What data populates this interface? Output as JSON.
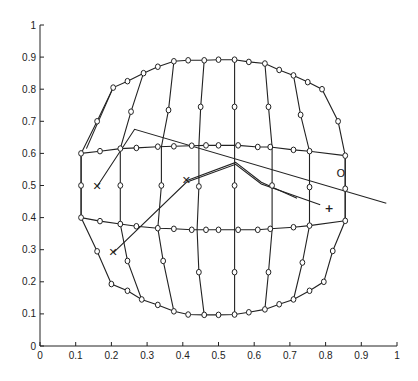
{
  "chart_data": {
    "type": "line",
    "title": "",
    "xlabel": "",
    "ylabel": "",
    "xlim": [
      0,
      1
    ],
    "ylim": [
      0,
      1
    ],
    "grid": false,
    "xticks": [
      "0",
      "0.1",
      "0.2",
      "0.3",
      "0.4",
      "0.5",
      "0.6",
      "0.7",
      "0.8",
      "0.9",
      "1"
    ],
    "yticks": [
      "0",
      "0.1",
      "0.2",
      "0.3",
      "0.4",
      "0.5",
      "0.6",
      "0.7",
      "0.8",
      "0.9",
      "1"
    ],
    "mesh_outline": {
      "name": "deformed grid boundary",
      "points": [
        [
          0.115,
          0.6
        ],
        [
          0.16,
          0.7
        ],
        [
          0.205,
          0.805
        ],
        [
          0.245,
          0.825
        ],
        [
          0.29,
          0.85
        ],
        [
          0.33,
          0.87
        ],
        [
          0.375,
          0.887
        ],
        [
          0.415,
          0.89
        ],
        [
          0.46,
          0.89
        ],
        [
          0.5,
          0.892
        ],
        [
          0.545,
          0.892
        ],
        [
          0.585,
          0.885
        ],
        [
          0.63,
          0.88
        ],
        [
          0.67,
          0.86
        ],
        [
          0.71,
          0.843
        ],
        [
          0.75,
          0.822
        ],
        [
          0.79,
          0.8
        ],
        [
          0.835,
          0.7
        ],
        [
          0.855,
          0.593
        ],
        [
          0.855,
          0.39
        ],
        [
          0.82,
          0.296
        ],
        [
          0.795,
          0.2
        ],
        [
          0.755,
          0.172
        ],
        [
          0.71,
          0.145
        ],
        [
          0.67,
          0.13
        ],
        [
          0.63,
          0.114
        ],
        [
          0.585,
          0.105
        ],
        [
          0.545,
          0.098
        ],
        [
          0.5,
          0.097
        ],
        [
          0.46,
          0.097
        ],
        [
          0.415,
          0.098
        ],
        [
          0.375,
          0.108
        ],
        [
          0.33,
          0.128
        ],
        [
          0.285,
          0.145
        ],
        [
          0.245,
          0.172
        ],
        [
          0.2,
          0.193
        ],
        [
          0.16,
          0.295
        ],
        [
          0.115,
          0.4
        ]
      ]
    },
    "mesh_rows": [
      {
        "name": "row-0.6",
        "points": [
          [
            0.115,
            0.6
          ],
          [
            0.168,
            0.607
          ],
          [
            0.225,
            0.615
          ],
          [
            0.27,
            0.617
          ],
          [
            0.33,
            0.621
          ],
          [
            0.375,
            0.622
          ],
          [
            0.425,
            0.624
          ],
          [
            0.465,
            0.625
          ],
          [
            0.5,
            0.625
          ],
          [
            0.555,
            0.625
          ],
          [
            0.61,
            0.62
          ],
          [
            0.645,
            0.62
          ],
          [
            0.71,
            0.611
          ],
          [
            0.755,
            0.607
          ],
          [
            0.855,
            0.593
          ]
        ]
      },
      {
        "name": "row-0.4",
        "points": [
          [
            0.115,
            0.4
          ],
          [
            0.168,
            0.389
          ],
          [
            0.225,
            0.38
          ],
          [
            0.27,
            0.373
          ],
          [
            0.33,
            0.367
          ],
          [
            0.375,
            0.365
          ],
          [
            0.425,
            0.362
          ],
          [
            0.465,
            0.362
          ],
          [
            0.5,
            0.362
          ],
          [
            0.555,
            0.362
          ],
          [
            0.61,
            0.362
          ],
          [
            0.645,
            0.365
          ],
          [
            0.71,
            0.37
          ],
          [
            0.755,
            0.375
          ],
          [
            0.855,
            0.39
          ]
        ]
      }
    ],
    "mesh_columns": [
      {
        "name": "col-1",
        "points": [
          [
            0.205,
            0.805
          ],
          [
            0.13,
            0.615
          ]
        ]
      },
      {
        "name": "col-2",
        "points": [
          [
            0.29,
            0.85
          ],
          [
            0.255,
            0.73
          ],
          [
            0.225,
            0.615
          ],
          [
            0.225,
            0.5
          ],
          [
            0.225,
            0.38
          ],
          [
            0.245,
            0.265
          ],
          [
            0.285,
            0.145
          ]
        ]
      },
      {
        "name": "col-3",
        "points": [
          [
            0.375,
            0.887
          ],
          [
            0.36,
            0.735
          ],
          [
            0.34,
            0.62
          ],
          [
            0.34,
            0.5
          ],
          [
            0.33,
            0.367
          ],
          [
            0.345,
            0.265
          ],
          [
            0.375,
            0.108
          ]
        ]
      },
      {
        "name": "col-4",
        "points": [
          [
            0.46,
            0.89
          ],
          [
            0.45,
            0.745
          ],
          [
            0.445,
            0.624
          ],
          [
            0.445,
            0.497
          ],
          [
            0.44,
            0.362
          ],
          [
            0.445,
            0.23
          ],
          [
            0.46,
            0.097
          ]
        ]
      },
      {
        "name": "col-5",
        "points": [
          [
            0.545,
            0.892
          ],
          [
            0.545,
            0.745
          ],
          [
            0.545,
            0.625
          ],
          [
            0.545,
            0.5
          ],
          [
            0.545,
            0.362
          ],
          [
            0.545,
            0.23
          ],
          [
            0.545,
            0.098
          ]
        ]
      },
      {
        "name": "col-6",
        "points": [
          [
            0.63,
            0.88
          ],
          [
            0.64,
            0.745
          ],
          [
            0.65,
            0.62
          ],
          [
            0.65,
            0.5
          ],
          [
            0.65,
            0.362
          ],
          [
            0.64,
            0.23
          ],
          [
            0.63,
            0.114
          ]
        ]
      },
      {
        "name": "col-7",
        "points": [
          [
            0.71,
            0.843
          ],
          [
            0.73,
            0.72
          ],
          [
            0.755,
            0.607
          ],
          [
            0.755,
            0.495
          ],
          [
            0.755,
            0.375
          ],
          [
            0.735,
            0.26
          ],
          [
            0.71,
            0.145
          ]
        ]
      },
      {
        "name": "col-left",
        "points": [
          [
            0.115,
            0.6
          ],
          [
            0.115,
            0.5
          ],
          [
            0.115,
            0.4
          ]
        ]
      },
      {
        "name": "col-right",
        "points": [
          [
            0.855,
            0.593
          ],
          [
            0.855,
            0.49
          ],
          [
            0.855,
            0.39
          ]
        ]
      }
    ],
    "nodes": [
      [
        0.115,
        0.6
      ],
      [
        0.115,
        0.5
      ],
      [
        0.115,
        0.4
      ],
      [
        0.16,
        0.7
      ],
      [
        0.205,
        0.805
      ],
      [
        0.245,
        0.825
      ],
      [
        0.29,
        0.85
      ],
      [
        0.33,
        0.87
      ],
      [
        0.375,
        0.887
      ],
      [
        0.415,
        0.89
      ],
      [
        0.46,
        0.89
      ],
      [
        0.5,
        0.892
      ],
      [
        0.545,
        0.892
      ],
      [
        0.585,
        0.885
      ],
      [
        0.63,
        0.88
      ],
      [
        0.67,
        0.86
      ],
      [
        0.71,
        0.843
      ],
      [
        0.75,
        0.822
      ],
      [
        0.79,
        0.8
      ],
      [
        0.835,
        0.7
      ],
      [
        0.855,
        0.593
      ],
      [
        0.855,
        0.49
      ],
      [
        0.855,
        0.39
      ],
      [
        0.82,
        0.296
      ],
      [
        0.795,
        0.2
      ],
      [
        0.755,
        0.172
      ],
      [
        0.71,
        0.145
      ],
      [
        0.67,
        0.13
      ],
      [
        0.63,
        0.114
      ],
      [
        0.585,
        0.105
      ],
      [
        0.545,
        0.098
      ],
      [
        0.5,
        0.097
      ],
      [
        0.46,
        0.097
      ],
      [
        0.415,
        0.098
      ],
      [
        0.375,
        0.108
      ],
      [
        0.33,
        0.128
      ],
      [
        0.285,
        0.145
      ],
      [
        0.245,
        0.172
      ],
      [
        0.2,
        0.193
      ],
      [
        0.16,
        0.295
      ],
      [
        0.168,
        0.607
      ],
      [
        0.225,
        0.615
      ],
      [
        0.27,
        0.617
      ],
      [
        0.33,
        0.621
      ],
      [
        0.375,
        0.622
      ],
      [
        0.425,
        0.624
      ],
      [
        0.465,
        0.625
      ],
      [
        0.5,
        0.625
      ],
      [
        0.555,
        0.625
      ],
      [
        0.61,
        0.62
      ],
      [
        0.645,
        0.62
      ],
      [
        0.71,
        0.611
      ],
      [
        0.755,
        0.607
      ],
      [
        0.168,
        0.389
      ],
      [
        0.225,
        0.38
      ],
      [
        0.27,
        0.373
      ],
      [
        0.33,
        0.367
      ],
      [
        0.375,
        0.365
      ],
      [
        0.425,
        0.362
      ],
      [
        0.465,
        0.362
      ],
      [
        0.5,
        0.362
      ],
      [
        0.555,
        0.362
      ],
      [
        0.61,
        0.362
      ],
      [
        0.645,
        0.365
      ],
      [
        0.71,
        0.37
      ],
      [
        0.755,
        0.375
      ],
      [
        0.255,
        0.73
      ],
      [
        0.36,
        0.735
      ],
      [
        0.45,
        0.745
      ],
      [
        0.545,
        0.745
      ],
      [
        0.64,
        0.745
      ],
      [
        0.73,
        0.72
      ],
      [
        0.225,
        0.5
      ],
      [
        0.34,
        0.5
      ],
      [
        0.445,
        0.497
      ],
      [
        0.545,
        0.5
      ],
      [
        0.65,
        0.5
      ],
      [
        0.755,
        0.495
      ],
      [
        0.245,
        0.265
      ],
      [
        0.345,
        0.265
      ],
      [
        0.445,
        0.23
      ],
      [
        0.545,
        0.23
      ],
      [
        0.64,
        0.23
      ],
      [
        0.735,
        0.26
      ]
    ],
    "trajectories": [
      {
        "name": "trajectory-a",
        "points": [
          [
            0.16,
            0.497
          ],
          [
            0.265,
            0.675
          ],
          [
            0.97,
            0.445
          ]
        ]
      },
      {
        "name": "trajectory-b",
        "points": [
          [
            0.205,
            0.29
          ],
          [
            0.41,
            0.51
          ],
          [
            0.548,
            0.566
          ],
          [
            0.62,
            0.505
          ],
          [
            0.785,
            0.44
          ]
        ]
      },
      {
        "name": "trajectory-b-offset",
        "points": [
          [
            0.41,
            0.515
          ],
          [
            0.548,
            0.572
          ],
          [
            0.62,
            0.51
          ],
          [
            0.72,
            0.46
          ]
        ]
      }
    ],
    "markers": [
      {
        "name": "x-marker-1",
        "symbol": "✕",
        "x": 0.16,
        "y": 0.497
      },
      {
        "name": "x-marker-2",
        "symbol": "✕",
        "x": 0.205,
        "y": 0.29
      },
      {
        "name": "x-marker-3",
        "symbol": "✕",
        "x": 0.41,
        "y": 0.514
      },
      {
        "name": "plus-marker",
        "symbol": "+",
        "x": 0.81,
        "y": 0.434
      },
      {
        "name": "o-marker",
        "symbol": "O",
        "x": 0.843,
        "y": 0.54
      }
    ]
  }
}
